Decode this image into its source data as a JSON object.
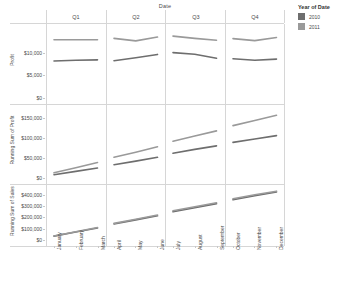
{
  "header": {
    "column_field_title": "Date",
    "quarters": [
      "Q1",
      "Q2",
      "Q3",
      "Q4"
    ]
  },
  "legend": {
    "title": "Year of Date",
    "items": [
      {
        "label": "2010",
        "color": "#6e6e6e"
      },
      {
        "label": "2011",
        "color": "#9a9a9a"
      }
    ]
  },
  "chart_data": {
    "type": "line",
    "title": "Date",
    "xlabel": "",
    "grid": true,
    "legend_position": "right",
    "legend_title": "Year of Date",
    "columns": [
      "Q1",
      "Q2",
      "Q3",
      "Q4"
    ],
    "x": [
      "January",
      "February",
      "March",
      "April",
      "May",
      "June",
      "July",
      "August",
      "September",
      "October",
      "November",
      "December"
    ],
    "rows": [
      {
        "ylabel": "Profit",
        "yticks": [
          "$10,000",
          "$5,000",
          "$0"
        ],
        "ytickvals": [
          10000,
          5000,
          0
        ],
        "ylim": [
          0,
          15500
        ],
        "series": [
          {
            "name": "2010",
            "color": "#6e6e6e",
            "values": [
              8200,
              8350,
              8450,
              8250,
              8900,
              9650,
              10050,
              9700,
              8800,
              8700,
              8350,
              8600
            ]
          },
          {
            "name": "2011",
            "color": "#9a9a9a",
            "values": [
              12900,
              12900,
              12900,
              13200,
              12650,
              13500,
              13700,
              13200,
              12800,
              13150,
              12700,
              13400
            ]
          }
        ]
      },
      {
        "ylabel": "Running Sum of Profit",
        "yticks": [
          "$150,000",
          "$100,000",
          "$50,000",
          "$0"
        ],
        "ytickvals": [
          150000,
          100000,
          50000,
          0
        ],
        "ylim": [
          0,
          175000
        ],
        "series": [
          {
            "name": "2010",
            "color": "#6e6e6e",
            "values": [
              8200,
              16550,
              25000,
              33250,
              42150,
              51800,
              61850,
              71550,
              80350,
              89050,
              97400,
              106000
            ]
          },
          {
            "name": "2011",
            "color": "#9a9a9a",
            "values": [
              12900,
              25800,
              38700,
              51900,
              64550,
              78050,
              91750,
              104950,
              117750,
              130900,
              143600,
              157000
            ]
          }
        ]
      },
      {
        "ylabel": "Running Sum of Sales",
        "yticks": [
          "$400,000",
          "$300,000",
          "$200,000",
          "$100,000",
          "$0"
        ],
        "ytickvals": [
          400000,
          300000,
          200000,
          100000,
          0
        ],
        "ylim": [
          0,
          460000
        ],
        "series": [
          {
            "name": "2010",
            "color": "#6e6e6e",
            "values": [
              34000,
              70000,
              106000,
              142000,
              178000,
              214000,
              250000,
              286000,
              322000,
              356000,
              392000,
              425000
            ]
          },
          {
            "name": "2011",
            "color": "#9a9a9a",
            "values": [
              36000,
              73000,
              110000,
              147000,
              184000,
              221000,
              258000,
              294000,
              330000,
              365000,
              400000,
              432000
            ]
          }
        ]
      }
    ]
  }
}
